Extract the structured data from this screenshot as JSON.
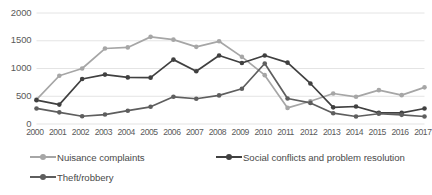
{
  "chart_data": {
    "type": "line",
    "title": "",
    "xlabel": "",
    "ylabel": "",
    "ylim": [
      0,
      2000
    ],
    "yticks": [
      0,
      500,
      1000,
      1500,
      2000
    ],
    "grid": true,
    "legend_position": "bottom",
    "categories": [
      "2000",
      "2001",
      "2002",
      "2003",
      "2004",
      "2005",
      "2006",
      "2007",
      "2008",
      "2009",
      "2010",
      "2011",
      "2012",
      "2013",
      "2014",
      "2015",
      "2016",
      "2017"
    ],
    "series": [
      {
        "name": "Nuisance complaints",
        "color": "#a6a6a6",
        "values": [
          440,
          870,
          1000,
          1360,
          1380,
          1570,
          1520,
          1390,
          1490,
          1210,
          880,
          290,
          410,
          550,
          490,
          610,
          520,
          660
        ]
      },
      {
        "name": "Social conflicts and problem resolution",
        "color": "#404040",
        "values": [
          430,
          350,
          810,
          890,
          840,
          835,
          1160,
          950,
          1235,
          1100,
          1235,
          1105,
          730,
          300,
          315,
          200,
          200,
          280
        ]
      },
      {
        "name": "Theft/robbery",
        "color": "#5e5e5e",
        "values": [
          280,
          210,
          140,
          170,
          240,
          310,
          490,
          455,
          515,
          635,
          1090,
          460,
          380,
          195,
          135,
          185,
          165,
          135
        ]
      }
    ]
  },
  "axis": {
    "y_tick_labels": [
      "2000",
      "1500",
      "1000",
      "500",
      "0"
    ],
    "x_tick_labels": [
      "2000",
      "2001",
      "2002",
      "2003",
      "2004",
      "2005",
      "2006",
      "2007",
      "2008",
      "2009",
      "2010",
      "2011",
      "2012",
      "2013",
      "2014",
      "2015",
      "2016",
      "2017"
    ]
  },
  "legend": {
    "items": [
      {
        "label": "Nuisance complaints",
        "color": "#a6a6a6"
      },
      {
        "label": "Social conflicts and problem resolution",
        "color": "#404040"
      },
      {
        "label": "Theft/robbery",
        "color": "#5e5e5e"
      }
    ]
  },
  "style": {
    "grid_color": "#e4e4e4",
    "tick_text_color": "#5a5a5a",
    "legend_text_color": "#4a4a4a",
    "background": "#ffffff"
  }
}
